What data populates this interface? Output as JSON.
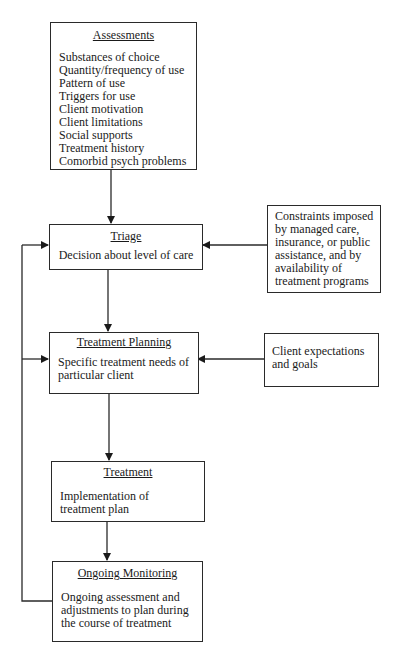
{
  "diagram": {
    "type": "flowchart",
    "nodes": {
      "assessments": {
        "title": "Assessments",
        "items": [
          "Substances of choice",
          "Quantity/frequency of use",
          "Pattern of use",
          "Triggers for use",
          "Client motivation",
          "Client limitations",
          "Social supports",
          "Treatment history",
          "Comorbid psych problems"
        ]
      },
      "triage": {
        "title": "Triage",
        "description": "Decision about level of care"
      },
      "constraints": {
        "text": "Constraints imposed by managed care, insurance, or public assistance, and by availability of treatment programs",
        "lines": [
          "Constraints imposed",
          "by managed care,",
          "insurance, or public",
          "assistance, and by",
          "availability of",
          "treatment programs"
        ]
      },
      "treatment_planning": {
        "title": "Treatment Planning",
        "description": "Specific treatment needs of particular client"
      },
      "client_expectations": {
        "text": "Client expectations and goals"
      },
      "treatment": {
        "title": "Treatment",
        "description": "Implementation of treatment plan"
      },
      "ongoing_monitoring": {
        "title": "Ongoing Monitoring",
        "description": "Ongoing assessment and adjustments to plan during the course of treatment"
      }
    },
    "edges": [
      {
        "from": "Assessments",
        "to": "Triage"
      },
      {
        "from": "Constraints",
        "to": "Triage"
      },
      {
        "from": "Triage",
        "to": "Treatment Planning"
      },
      {
        "from": "Client expectations and goals",
        "to": "Treatment Planning"
      },
      {
        "from": "Treatment Planning",
        "to": "Treatment"
      },
      {
        "from": "Treatment",
        "to": "Ongoing Monitoring"
      },
      {
        "from": "Ongoing Monitoring",
        "to": "Triage"
      },
      {
        "from": "Ongoing Monitoring",
        "to": "Treatment Planning"
      }
    ]
  }
}
